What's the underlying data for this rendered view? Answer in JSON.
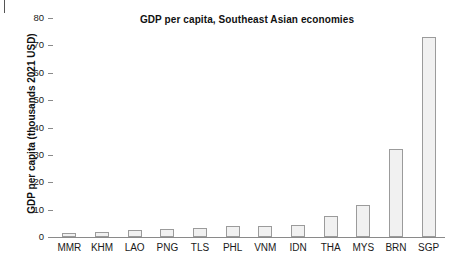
{
  "chart_data": {
    "type": "bar",
    "title": "GDP per capita, Southeast Asian economies",
    "xlabel": "",
    "ylabel": "GDP per capita (thousands 2021 USD)",
    "categories": [
      "MMR",
      "KHM",
      "LAO",
      "PNG",
      "TLS",
      "PHL",
      "VNM",
      "IDN",
      "THA",
      "MYS",
      "BRN",
      "SGP"
    ],
    "values": [
      1.5,
      1.8,
      2.7,
      2.8,
      3.3,
      4.0,
      4.1,
      4.4,
      7.7,
      11.8,
      32.2,
      73.2
    ],
    "ylim": [
      0,
      80
    ],
    "yticks": [
      0,
      10,
      20,
      30,
      40,
      50,
      60,
      70,
      80
    ],
    "ytick_labels": [
      "0",
      "10",
      "20",
      "30",
      "40",
      "50",
      "60",
      "70",
      "80"
    ],
    "grid": false,
    "legend": null,
    "bar_fill_color": "#f1f1f1",
    "bar_edge_color": "#9b9b9b",
    "axis_color": "#8a8a8a",
    "text_color": "#1a1a1a",
    "background_color": "#ffffff"
  }
}
